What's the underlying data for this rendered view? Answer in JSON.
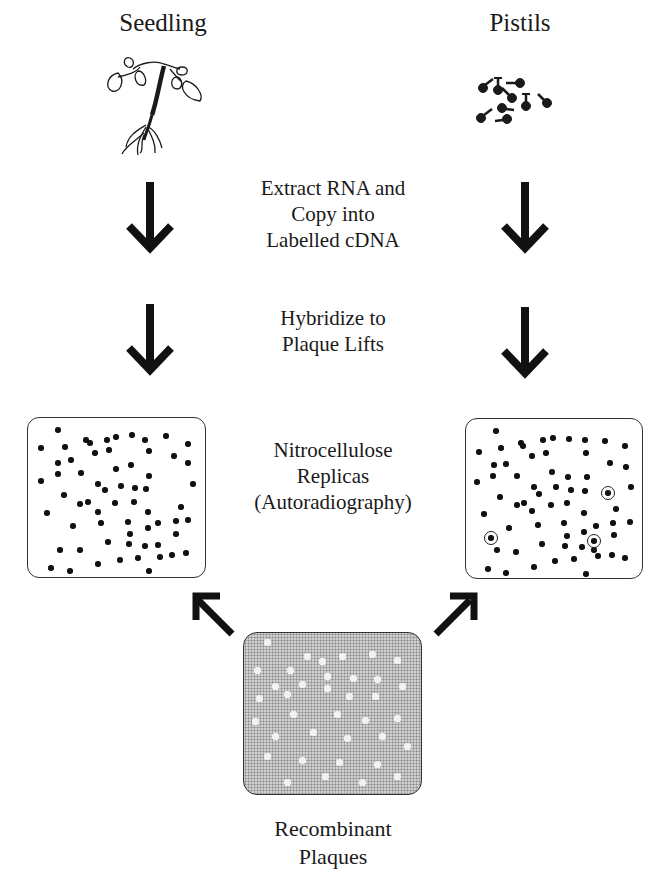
{
  "diagram": {
    "left_source": {
      "title": "Seedling",
      "icon": "seedling-icon"
    },
    "right_source": {
      "title": "Pistils",
      "icon": "pistils-icon"
    },
    "steps": [
      {
        "line1": "Extract RNA and",
        "line2": "Copy into",
        "line3": "Labelled cDNA"
      },
      {
        "line1": "Hybridize to",
        "line2": "Plaque Lifts"
      }
    ],
    "replicas": {
      "line1": "Nitrocellulose",
      "line2": "Replicas",
      "line3": "(Autoradiography)"
    },
    "source_plate": {
      "line1": "Recombinant",
      "line2": "Plaques"
    },
    "left_replica": {
      "description": "Seedling probe hybridization – no highlighted plaques",
      "dots": [
        [
          30,
          12
        ],
        [
          13,
          30
        ],
        [
          37,
          29
        ],
        [
          58,
          22
        ],
        [
          62,
          25
        ],
        [
          79,
          22
        ],
        [
          88,
          19
        ],
        [
          104,
          17
        ],
        [
          117,
          22
        ],
        [
          138,
          18
        ],
        [
          160,
          26
        ],
        [
          67,
          35
        ],
        [
          81,
          32
        ],
        [
          121,
          33
        ],
        [
          146,
          38
        ],
        [
          160,
          45
        ],
        [
          30,
          45
        ],
        [
          43,
          42
        ],
        [
          30,
          56
        ],
        [
          53,
          55
        ],
        [
          88,
          51
        ],
        [
          103,
          47
        ],
        [
          121,
          58
        ],
        [
          13,
          63
        ],
        [
          70,
          66
        ],
        [
          77,
          72
        ],
        [
          93,
          68
        ],
        [
          107,
          70
        ],
        [
          118,
          71
        ],
        [
          165,
          66
        ],
        [
          36,
          77
        ],
        [
          52,
          86
        ],
        [
          60,
          84
        ],
        [
          87,
          85
        ],
        [
          106,
          84
        ],
        [
          70,
          94
        ],
        [
          19,
          95
        ],
        [
          120,
          94
        ],
        [
          153,
          89
        ],
        [
          45,
          108
        ],
        [
          73,
          105
        ],
        [
          100,
          104
        ],
        [
          120,
          110
        ],
        [
          130,
          105
        ],
        [
          148,
          103
        ],
        [
          160,
          102
        ],
        [
          102,
          116
        ],
        [
          148,
          116
        ],
        [
          80,
          124
        ],
        [
          101,
          126
        ],
        [
          117,
          128
        ],
        [
          32,
          132
        ],
        [
          52,
          132
        ],
        [
          130,
          127
        ],
        [
          92,
          142
        ],
        [
          110,
          140
        ],
        [
          132,
          139
        ],
        [
          144,
          137
        ],
        [
          158,
          135
        ],
        [
          23,
          150
        ],
        [
          42,
          153
        ],
        [
          70,
          146
        ],
        [
          121,
          153
        ]
      ]
    },
    "right_replica": {
      "description": "Pistil probe hybridization – three pistil-specific plaques circled",
      "dots": [
        [
          30,
          12
        ],
        [
          13,
          33
        ],
        [
          35,
          29
        ],
        [
          55,
          24
        ],
        [
          57,
          27
        ],
        [
          77,
          21
        ],
        [
          87,
          19
        ],
        [
          103,
          20
        ],
        [
          119,
          21
        ],
        [
          139,
          22
        ],
        [
          159,
          27
        ],
        [
          66,
          37
        ],
        [
          80,
          34
        ],
        [
          120,
          34
        ],
        [
          144,
          44
        ],
        [
          160,
          48
        ],
        [
          28,
          46
        ],
        [
          40,
          45
        ],
        [
          27,
          57
        ],
        [
          51,
          57
        ],
        [
          86,
          53
        ],
        [
          102,
          58
        ],
        [
          121,
          58
        ],
        [
          11,
          63
        ],
        [
          68,
          68
        ],
        [
          73,
          75
        ],
        [
          90,
          68
        ],
        [
          105,
          71
        ],
        [
          119,
          72
        ],
        [
          165,
          68
        ],
        [
          34,
          78
        ],
        [
          51,
          86
        ],
        [
          58,
          84
        ],
        [
          85,
          86
        ],
        [
          101,
          84
        ],
        [
          66,
          92
        ],
        [
          18,
          95
        ],
        [
          118,
          94
        ],
        [
          150,
          90
        ],
        [
          43,
          109
        ],
        [
          72,
          106
        ],
        [
          98,
          104
        ],
        [
          118,
          113
        ],
        [
          130,
          107
        ],
        [
          147,
          104
        ],
        [
          164,
          103
        ],
        [
          101,
          117
        ],
        [
          148,
          116
        ],
        [
          76,
          125
        ],
        [
          99,
          127
        ],
        [
          116,
          128
        ],
        [
          31,
          131
        ],
        [
          50,
          133
        ],
        [
          128,
          131
        ],
        [
          89,
          142
        ],
        [
          108,
          140
        ],
        [
          132,
          137
        ],
        [
          146,
          136
        ],
        [
          159,
          139
        ],
        [
          22,
          150
        ],
        [
          40,
          154
        ],
        [
          68,
          148
        ],
        [
          120,
          155
        ]
      ],
      "circled": [
        [
          142,
          74
        ],
        [
          25,
          119
        ],
        [
          128,
          122
        ]
      ]
    },
    "source_holes": [
      [
        20,
        6
      ],
      [
        60,
        20
      ],
      [
        75,
        25
      ],
      [
        95,
        20
      ],
      [
        125,
        18
      ],
      [
        150,
        24
      ],
      [
        10,
        34
      ],
      [
        43,
        34
      ],
      [
        80,
        40
      ],
      [
        106,
        42
      ],
      [
        28,
        50
      ],
      [
        55,
        48
      ],
      [
        80,
        52
      ],
      [
        130,
        43
      ],
      [
        155,
        50
      ],
      [
        12,
        62
      ],
      [
        40,
        58
      ],
      [
        102,
        60
      ],
      [
        128,
        60
      ],
      [
        8,
        85
      ],
      [
        46,
        78
      ],
      [
        90,
        78
      ],
      [
        118,
        84
      ],
      [
        150,
        82
      ],
      [
        28,
        100
      ],
      [
        66,
        96
      ],
      [
        100,
        102
      ],
      [
        135,
        100
      ],
      [
        160,
        110
      ],
      [
        20,
        120
      ],
      [
        55,
        124
      ],
      [
        92,
        126
      ],
      [
        130,
        128
      ],
      [
        40,
        146
      ],
      [
        78,
        140
      ],
      [
        115,
        146
      ],
      [
        150,
        140
      ]
    ]
  }
}
